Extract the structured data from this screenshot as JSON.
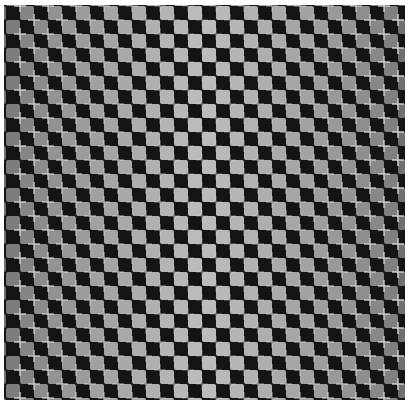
{
  "image": {
    "description": "Checkerboard illusion with light crosses at square intersections",
    "cell_size": 14,
    "offset_x": 16,
    "offset_y": 1,
    "columns": 28,
    "rows": 29,
    "colors": {
      "background": "#141414",
      "square_edge": "#707070",
      "square_center": "#bdbdbd",
      "cross": "#e0e0e0"
    }
  }
}
